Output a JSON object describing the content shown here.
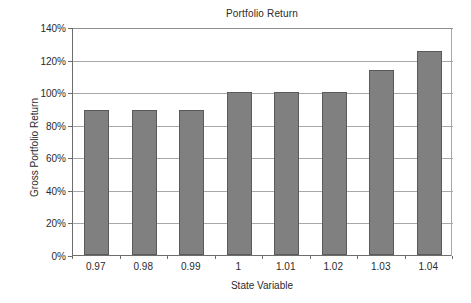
{
  "chart_data": {
    "type": "bar",
    "title": "Portfolio Return",
    "xlabel": "State Variable",
    "ylabel": "Gross Portfolio Return",
    "categories": [
      "0.97",
      "0.98",
      "0.99",
      "1",
      "1.01",
      "1.02",
      "1.03",
      "1.04"
    ],
    "values": [
      88.8,
      88.8,
      88.8,
      100,
      100,
      100,
      113.8,
      125.2
    ],
    "value_unit": "%",
    "ylim": [
      0,
      140
    ],
    "ytick_labels": [
      "0%",
      "20%",
      "40%",
      "60%",
      "80%",
      "100%",
      "120%",
      "140%"
    ],
    "ytick_values": [
      0,
      20,
      40,
      60,
      80,
      100,
      120,
      140
    ],
    "grid": true,
    "grid_axis": "y",
    "legend": false,
    "series": [
      {
        "name": "Gross Portfolio Return",
        "values": [
          88.8,
          88.8,
          88.8,
          100,
          100,
          100,
          113.8,
          125.2
        ],
        "color": "#808080",
        "border_color": "#5a5a5a"
      }
    ]
  },
  "colors": {
    "background": "#ffffff",
    "bar_fill": "#808080",
    "bar_border": "#5a5a5a",
    "gridline": "#a8a8a8",
    "axis": "#6d6d6d",
    "text": "#2b2b2b"
  }
}
